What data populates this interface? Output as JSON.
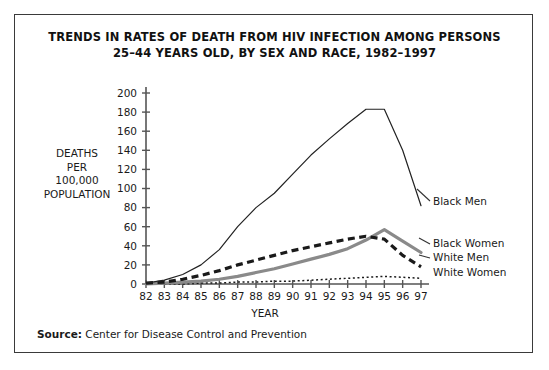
{
  "title": {
    "line1": "TRENDS IN RATES OF DEATH FROM HIV INFECTION AMONG PERSONS",
    "line2": "25–44 YEARS OLD, BY SEX AND RACE, 1982–1997"
  },
  "axis_label_y": {
    "l1": "DEATHS",
    "l2": "PER",
    "l3": "100,000",
    "l4": "POPULATION"
  },
  "axis_label_x": "YEAR",
  "source": {
    "prefix": "Source:",
    "text": " Center for Disease Control and Prevention"
  },
  "chart_data": {
    "type": "line",
    "title": "TRENDS IN RATES OF DEATH FROM HIV INFECTION AMONG PERSONS 25–44 YEARS OLD, BY SEX AND RACE, 1982–1997",
    "xlabel": "YEAR",
    "ylabel": "DEATHS PER 100,000 POPULATION",
    "grid": false,
    "legend_position": "right-inline",
    "categories": [
      "82",
      "83",
      "84",
      "85",
      "86",
      "87",
      "88",
      "89",
      "90",
      "91",
      "92",
      "93",
      "94",
      "95",
      "96",
      "97"
    ],
    "x": [
      1982,
      1983,
      1984,
      1985,
      1986,
      1987,
      1988,
      1989,
      1990,
      1991,
      1992,
      1993,
      1994,
      1995,
      1996,
      1997
    ],
    "xlim": [
      1982,
      1997
    ],
    "ylim": [
      0,
      200
    ],
    "ytick_values": [
      0,
      20,
      40,
      60,
      80,
      100,
      120,
      140,
      160,
      180,
      200
    ],
    "ytick_labels": [
      "0",
      "20",
      "40",
      "60",
      "80",
      "100",
      "120",
      "140",
      "160",
      "180",
      "200"
    ],
    "series": [
      {
        "name": "Black Men",
        "style": "solid-thin-black",
        "color": "#222222",
        "values": [
          1,
          4,
          10,
          20,
          36,
          60,
          80,
          95,
          115,
          135,
          152,
          168,
          183,
          183,
          140,
          82
        ]
      },
      {
        "name": "Black Women",
        "style": "solid-thick-gray",
        "color": "#8a8a8a",
        "values": [
          0,
          1,
          2,
          3,
          5,
          8,
          12,
          16,
          21,
          26,
          31,
          37,
          46,
          57,
          45,
          33
        ]
      },
      {
        "name": "White Men",
        "style": "dashed-thick-black",
        "color": "#1a1a1a",
        "values": [
          1,
          2,
          5,
          9,
          14,
          20,
          25,
          30,
          35,
          39,
          43,
          47,
          50,
          47,
          30,
          18
        ]
      },
      {
        "name": "White Women",
        "style": "dotted-thin-black",
        "color": "#1a1a1a",
        "values": [
          0,
          0,
          0,
          1,
          1,
          2,
          2,
          3,
          3,
          4,
          5,
          6,
          7,
          8,
          7,
          6
        ]
      }
    ]
  }
}
